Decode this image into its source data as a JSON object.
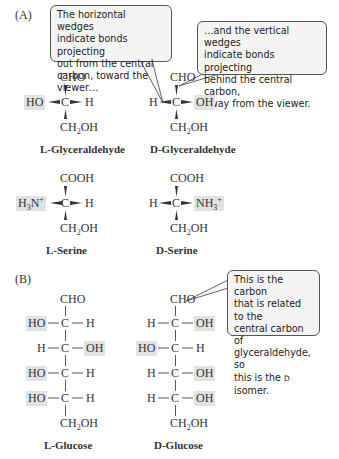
{
  "panels": {
    "A": {
      "label": "(A)"
    },
    "B": {
      "label": "(B)"
    }
  },
  "callouts": {
    "horizontal": "The horizontal wedges indicate bonds projecting out from the central carbon, toward the viewer…",
    "horizontal_lines": [
      "The horizontal wedges",
      "indicate bonds projecting",
      "out from the central",
      "carbon, toward the viewer…"
    ],
    "vertical_lines": [
      "…and the vertical wedges",
      "indicate bonds projecting",
      "behind the central carbon,",
      "away from the viewer."
    ],
    "carbon_lines": [
      "This is the carbon",
      "that is related to the",
      "central carbon of",
      "glyceraldehyde, so",
      "this is the D isomer."
    ]
  },
  "molecules": {
    "l_glyceraldehyde": {
      "top": "CHO",
      "left": "HO",
      "center": "C",
      "right": "H",
      "bottom": "CH2OH",
      "highlight": "left",
      "prefix": "L",
      "name": "-Glyceraldehyde"
    },
    "d_glyceraldehyde": {
      "top": "CHO",
      "left": "H",
      "center": "C",
      "right": "OH",
      "bottom": "CH2OH",
      "highlight": "right",
      "prefix": "D",
      "name": "-Glyceraldehyde"
    },
    "l_serine": {
      "top": "COOH",
      "left": "H3N+",
      "center": "C",
      "right": "H",
      "bottom": "CH2OH",
      "highlight": "left",
      "prefix": "L",
      "name": "-Serine"
    },
    "d_serine": {
      "top": "COOH",
      "left": "H",
      "center": "C",
      "right": "NH3+",
      "bottom": "CH2OH",
      "highlight": "right",
      "prefix": "D",
      "name": "-Serine"
    },
    "l_glucose": {
      "top": "CHO",
      "rows": [
        {
          "left": "HO",
          "right": "H",
          "highlight": "left"
        },
        {
          "left": "H",
          "right": "OH",
          "highlight": "right"
        },
        {
          "left": "HO",
          "right": "H",
          "highlight": "left"
        },
        {
          "left": "HO",
          "right": "H",
          "highlight": "left"
        }
      ],
      "bottom": "CH2OH",
      "prefix": "L",
      "name": "-Glucose"
    },
    "d_glucose": {
      "top": "CHO",
      "rows": [
        {
          "left": "H",
          "right": "OH",
          "highlight": "right"
        },
        {
          "left": "HO",
          "right": "H",
          "highlight": "left"
        },
        {
          "left": "H",
          "right": "OH",
          "highlight": "right"
        },
        {
          "left": "H",
          "right": "OH",
          "highlight": "right"
        }
      ],
      "bottom": "CH2OH",
      "prefix": "D",
      "name": "-Glucose"
    }
  },
  "text": {
    "CHO": "CHO",
    "COOH": "COOH",
    "C": "C",
    "H": "H",
    "HO": "HO",
    "OH": "OH",
    "CH": "CH",
    "two": "2",
    "three": "3",
    "plus": "+",
    "N": "N",
    "NH": "NH",
    "dash": "—",
    "L": "L",
    "D": "D"
  },
  "colors": {
    "highlight": "#e2e2e2",
    "callout_bg": "#f4f4f4",
    "callout_border": "#555555",
    "text": "#333333"
  }
}
